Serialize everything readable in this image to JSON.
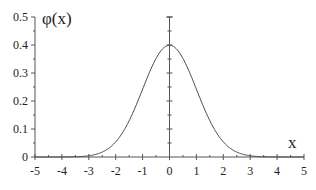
{
  "chart_data": {
    "type": "line",
    "title": "",
    "xlabel": "x",
    "ylabel": "φ(x)",
    "xlim": [
      -5,
      5
    ],
    "ylim": [
      0,
      0.5
    ],
    "grid": false,
    "legend": null,
    "x_ticks": [
      "-5",
      "-4",
      "-3",
      "-2",
      "-1",
      "0",
      "1",
      "2",
      "3",
      "4",
      "5"
    ],
    "y_ticks": [
      "0",
      "0.1",
      "0.2",
      "0.3",
      "0.4",
      "0.5"
    ],
    "series": [
      {
        "name": "standard normal density φ(x)",
        "x": [
          -5,
          -4,
          -3,
          -2.5,
          -2,
          -1.5,
          -1,
          -0.5,
          0,
          0.5,
          1,
          1.5,
          2,
          2.5,
          3,
          4,
          5
        ],
        "y": [
          0.0,
          0.0001,
          0.0044,
          0.0175,
          0.054,
          0.1295,
          0.242,
          0.3521,
          0.3989,
          0.3521,
          0.242,
          0.1295,
          0.054,
          0.0175,
          0.0044,
          0.0001,
          0.0
        ]
      }
    ],
    "layout": {
      "plot_left_px": 35,
      "plot_right_px": 304,
      "y0_px": 157,
      "ytop_px": 17,
      "center_axis_x": 0
    }
  }
}
